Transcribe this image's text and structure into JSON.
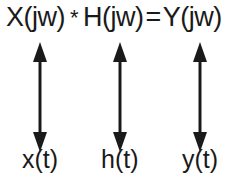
{
  "equation": {
    "left": "X(jw)",
    "multiply": "*",
    "middle": "H(jw)",
    "equals": "=",
    "right": "Y(jw)"
  },
  "time_domain": {
    "x": "x(t)",
    "h": "h(t)",
    "y": "y(t)"
  }
}
